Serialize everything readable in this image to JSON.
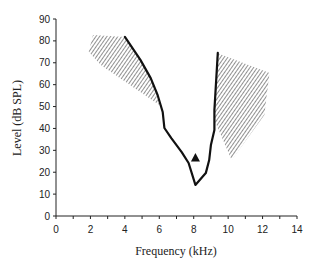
{
  "chart_data": {
    "type": "line",
    "title": "",
    "xlabel": "Frequency (kHz)",
    "ylabel": "Level (dB SPL)",
    "xlim": [
      0,
      14
    ],
    "ylim": [
      0,
      90
    ],
    "xticks": [
      0,
      2,
      4,
      6,
      8,
      10,
      12,
      14
    ],
    "xminor_step": 1,
    "yticks": [
      0,
      10,
      20,
      30,
      40,
      50,
      60,
      70,
      80,
      90
    ],
    "grid": false,
    "legend": null,
    "series": [
      {
        "name": "tuning curve",
        "style": "solid-black-line",
        "points": [
          [
            4.0,
            81.8
          ],
          [
            4.9,
            71.3
          ],
          [
            5.5,
            63.0
          ],
          [
            5.9,
            55.3
          ],
          [
            6.2,
            47.5
          ],
          [
            6.3,
            40.2
          ],
          [
            6.7,
            35.6
          ],
          [
            7.3,
            29.2
          ],
          [
            7.7,
            24.2
          ],
          [
            8.1,
            14.2
          ],
          [
            8.7,
            19.6
          ],
          [
            8.9,
            25.6
          ],
          [
            9.0,
            32.4
          ],
          [
            9.2,
            39.3
          ],
          [
            9.2,
            48.4
          ],
          [
            9.4,
            74.5
          ]
        ]
      },
      {
        "name": "marker",
        "style": "filled-triangle",
        "points": [
          [
            8.1,
            26.5
          ]
        ]
      }
    ],
    "shaded_regions": [
      {
        "name": "low-frequency inhibitory area",
        "pattern": "diagonal-hatch",
        "polygon": [
          [
            2.15,
            82.7
          ],
          [
            4.0,
            81.8
          ],
          [
            4.9,
            71.3
          ],
          [
            5.5,
            63.0
          ],
          [
            6.0,
            50.7
          ],
          [
            4.3,
            59.8
          ],
          [
            2.6,
            69.0
          ],
          [
            1.9,
            75.0
          ]
        ]
      },
      {
        "name": "high-frequency inhibitory area",
        "pattern": "diagonal-hatch",
        "polygon": [
          [
            9.35,
            74.5
          ],
          [
            12.4,
            65.3
          ],
          [
            12.1,
            46.1
          ],
          [
            10.2,
            25.6
          ],
          [
            9.2,
            43.9
          ]
        ]
      }
    ]
  }
}
